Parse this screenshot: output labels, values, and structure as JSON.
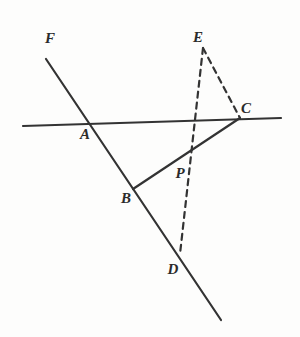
{
  "figure": {
    "type": "line-diagram",
    "canvas": {
      "width": 300,
      "height": 337,
      "background": "#fdfdfc"
    },
    "ink_color": "#333333",
    "stroke_width": 2.2,
    "dash_pattern": "6 5",
    "points": [
      {
        "id": "F",
        "label": "F",
        "x": 46,
        "y": 59,
        "label_x": 50,
        "label_y": 43,
        "kind": "ray-endpoint"
      },
      {
        "id": "A",
        "label": "A",
        "x": 88,
        "y": 123,
        "label_x": 85,
        "label_y": 139,
        "kind": "intersection"
      },
      {
        "id": "B",
        "label": "B",
        "x": 133,
        "y": 189,
        "label_x": 126,
        "label_y": 203,
        "kind": "vertex"
      },
      {
        "id": "C",
        "label": "C",
        "x": 240,
        "y": 118,
        "label_x": 246,
        "label_y": 113,
        "kind": "vertex"
      },
      {
        "id": "D",
        "label": "D",
        "x": 180,
        "y": 254,
        "label_x": 173,
        "label_y": 274,
        "kind": "vertex"
      },
      {
        "id": "E",
        "label": "E",
        "x": 203,
        "y": 48,
        "label_x": 198,
        "label_y": 42,
        "kind": "apex"
      },
      {
        "id": "P",
        "label": "P",
        "x": 188,
        "y": 155,
        "label_x": 180,
        "label_y": 178,
        "kind": "intersection"
      }
    ],
    "segments": [
      {
        "id": "horizontal-transversal",
        "name": "line-through-A-and-C",
        "from": [
          23,
          126
        ],
        "to": [
          281,
          118
        ],
        "style": "solid"
      },
      {
        "id": "oblique-line-FD",
        "name": "line-F-through-A-B-D",
        "from": [
          46,
          59
        ],
        "to": [
          221,
          320
        ],
        "style": "solid"
      },
      {
        "id": "segment-BC",
        "name": "segment-B-to-C",
        "from": [
          133,
          189
        ],
        "to": [
          240,
          118
        ],
        "style": "solid"
      },
      {
        "id": "segment-ED",
        "name": "dashed-segment-E-to-D",
        "from": [
          203,
          48
        ],
        "to": [
          180,
          254
        ],
        "style": "dashed"
      },
      {
        "id": "segment-EC",
        "name": "dashed-segment-E-to-C",
        "from": [
          203,
          48
        ],
        "to": [
          240,
          118
        ],
        "style": "dashed"
      }
    ],
    "labels_order": [
      "F",
      "E",
      "C",
      "A",
      "B",
      "P",
      "D"
    ]
  }
}
